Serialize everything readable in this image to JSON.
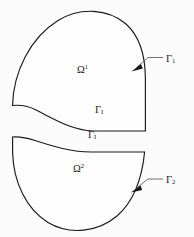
{
  "figure": {
    "type": "domain-decomposition-diagram",
    "background_color": "#fbfbfc",
    "stroke_color": "#1a1a1a",
    "leader_color": "#55555c",
    "regions": [
      {
        "name": "upper-subdomain",
        "label_base": "Ω",
        "label_superscript": "1",
        "outer_boundary": "Γ₁",
        "interface": "Γᵢ"
      },
      {
        "name": "lower-subdomain",
        "label_base": "Ω",
        "label_superscript": "2",
        "outer_boundary": "Γ₂",
        "interface": "Γᵢ"
      }
    ],
    "labels": {
      "omega_1": {
        "base": "Ω",
        "sup": "1"
      },
      "omega_2": {
        "base": "Ω",
        "sup": "2"
      },
      "gamma_1": {
        "base": "Γ",
        "sub": "1"
      },
      "gamma_2": {
        "base": "Γ",
        "sub": "2"
      },
      "gamma_interface_upper": {
        "base": "Γ",
        "sub": "I"
      },
      "gamma_interface_lower": {
        "base": "Γ",
        "sub": "I"
      }
    }
  }
}
